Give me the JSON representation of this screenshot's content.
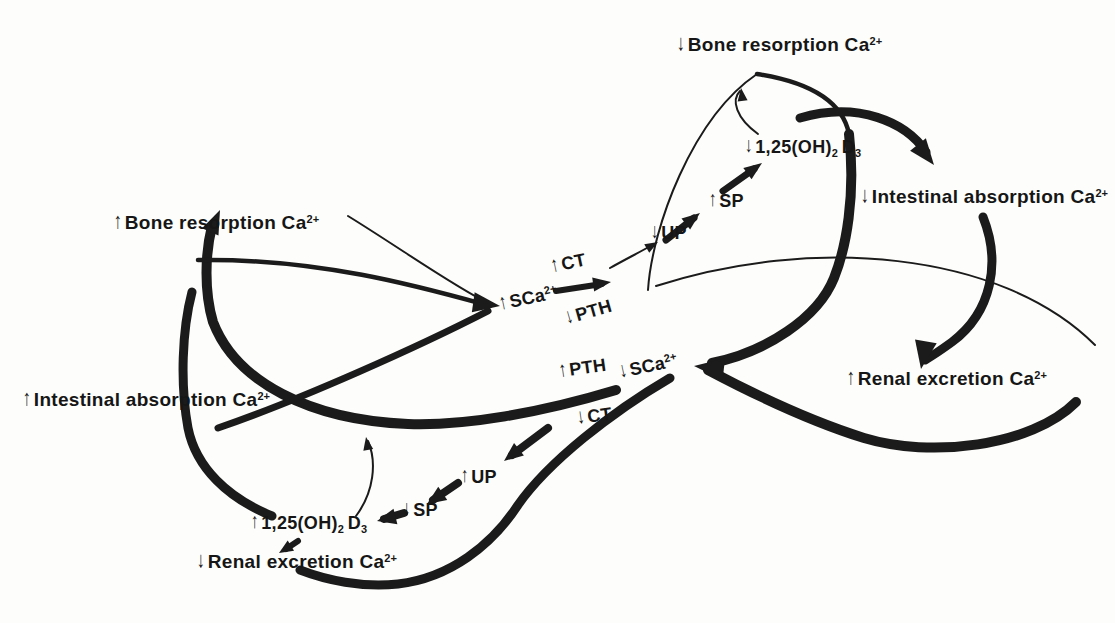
{
  "figure": {
    "colors": {
      "ink": "#1b1b1b",
      "background": "#fdfdfb"
    },
    "labels": {
      "top_bone": {
        "arrow": "↓",
        "pre": "Bone resorption Ca",
        "sup": "2+"
      },
      "top_d3": {
        "arrow": "↓",
        "pre": "1,25(OH)",
        "sub_a": "2",
        "mid": "D",
        "sub_b": "3"
      },
      "top_sp": {
        "arrow": "↑",
        "pre": "SP"
      },
      "top_up": {
        "arrow": "↓",
        "pre": "UP"
      },
      "up_ct": {
        "arrow": "↑",
        "pre": "CT"
      },
      "up_sca": {
        "arrow": "↑",
        "pre": "SCa",
        "sup": "2+"
      },
      "up_pth": {
        "arrow": "↓",
        "pre": "PTH"
      },
      "right_int": {
        "arrow": "↓",
        "pre": "Intestinal absorption Ca",
        "sup": "2+"
      },
      "right_renal": {
        "arrow": "↑",
        "pre": "Renal excretion Ca",
        "sup": "2+"
      },
      "low_pth": {
        "arrow": "↑",
        "pre": "PTH"
      },
      "low_sca": {
        "arrow": "↓",
        "pre": "SCa",
        "sup": "2+"
      },
      "low_ct": {
        "arrow": "↓",
        "pre": "CT"
      },
      "left_bone": {
        "arrow": "↑",
        "pre": "Bone resorption Ca",
        "sup": "2+"
      },
      "left_int": {
        "arrow": "↑",
        "pre": "Intestinal absorption Ca",
        "sup": "2+"
      },
      "bot_d3": {
        "arrow": "↑",
        "pre": "1,25(OH)",
        "sub_a": "2",
        "mid": "D",
        "sub_b": "3"
      },
      "bot_renal": {
        "arrow": "↓",
        "pre": "Renal excretion Ca",
        "sup": "2+"
      },
      "bot_sp": {
        "arrow": "↓",
        "pre": "SP"
      },
      "bot_up": {
        "arrow": "↑",
        "pre": "UP"
      }
    }
  }
}
